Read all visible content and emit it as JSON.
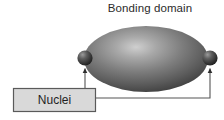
{
  "figure": {
    "title": "Bonding domain",
    "background_color": "#ffffff"
  },
  "labels": {
    "nuclei": {
      "text": "Nuclei",
      "box_fill": "#d9d9d9",
      "box_border": "#5a5a5a",
      "text_color": "#1f1f1f"
    }
  },
  "shapes": {
    "bonding_domain": {
      "name": "Bonding domain",
      "type": "ellipse",
      "fill_dark": "#4a4a4a",
      "fill_mid": "#6e6e6e",
      "highlight": "#c9c9c9",
      "cx": 146,
      "cy": 59,
      "rx": 62,
      "ry": 33
    },
    "nucleus_left": {
      "name": "Left nucleus",
      "type": "sphere",
      "cx": 85,
      "cy": 58,
      "r": 7.5,
      "fill_dark": "#2a2a2a",
      "fill_light": "#8a8a8a"
    },
    "nucleus_right": {
      "name": "Right nucleus",
      "type": "sphere",
      "cx": 210,
      "cy": 58,
      "r": 7.5,
      "fill_dark": "#2a2a2a",
      "fill_light": "#8a8a8a"
    }
  },
  "connectors": {
    "line_color": "#555555",
    "left_arrow": {
      "name": "arrow to left nucleus",
      "from_x": 85,
      "from_y": 88,
      "to_x": 85,
      "to_y": 68
    },
    "right_arrow": {
      "name": "arrow to right nucleus",
      "from_x": 210,
      "from_y": 98,
      "to_x": 210,
      "to_y": 68
    },
    "right_lead": {
      "name": "lead from label box to right arrow",
      "from_x": 96,
      "from_y": 98,
      "to_x": 210,
      "to_y": 98
    }
  }
}
